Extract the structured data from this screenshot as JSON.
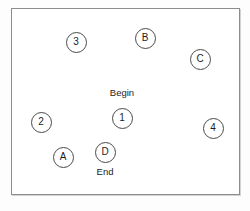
{
  "figure": {
    "type": "node-diagram",
    "background_color": "#fdfdfd",
    "frame": {
      "name": "diagram-border",
      "fill": "#ffffff",
      "stroke": "#8d8d8d",
      "x": 11,
      "y": 8,
      "width": 229,
      "height": 187
    },
    "nodes": [
      {
        "label": "3",
        "group": "numbered",
        "x": 76,
        "y": 42
      },
      {
        "label": "B",
        "group": "lettered",
        "x": 145,
        "y": 38
      },
      {
        "label": "C",
        "group": "lettered",
        "x": 200,
        "y": 59
      },
      {
        "label": "2",
        "group": "numbered",
        "x": 41,
        "y": 122
      },
      {
        "label": "1",
        "group": "numbered",
        "x": 122,
        "y": 118
      },
      {
        "label": "4",
        "group": "numbered",
        "x": 213,
        "y": 128
      },
      {
        "label": "A",
        "group": "lettered",
        "x": 63,
        "y": 157
      },
      {
        "label": "D",
        "group": "lettered",
        "x": 105,
        "y": 152
      }
    ],
    "captions": [
      {
        "text": "Begin",
        "x": 122,
        "y": 88,
        "anchor_node": "1"
      },
      {
        "text": "End",
        "x": 105,
        "y": 167,
        "anchor_node": "D"
      }
    ]
  }
}
